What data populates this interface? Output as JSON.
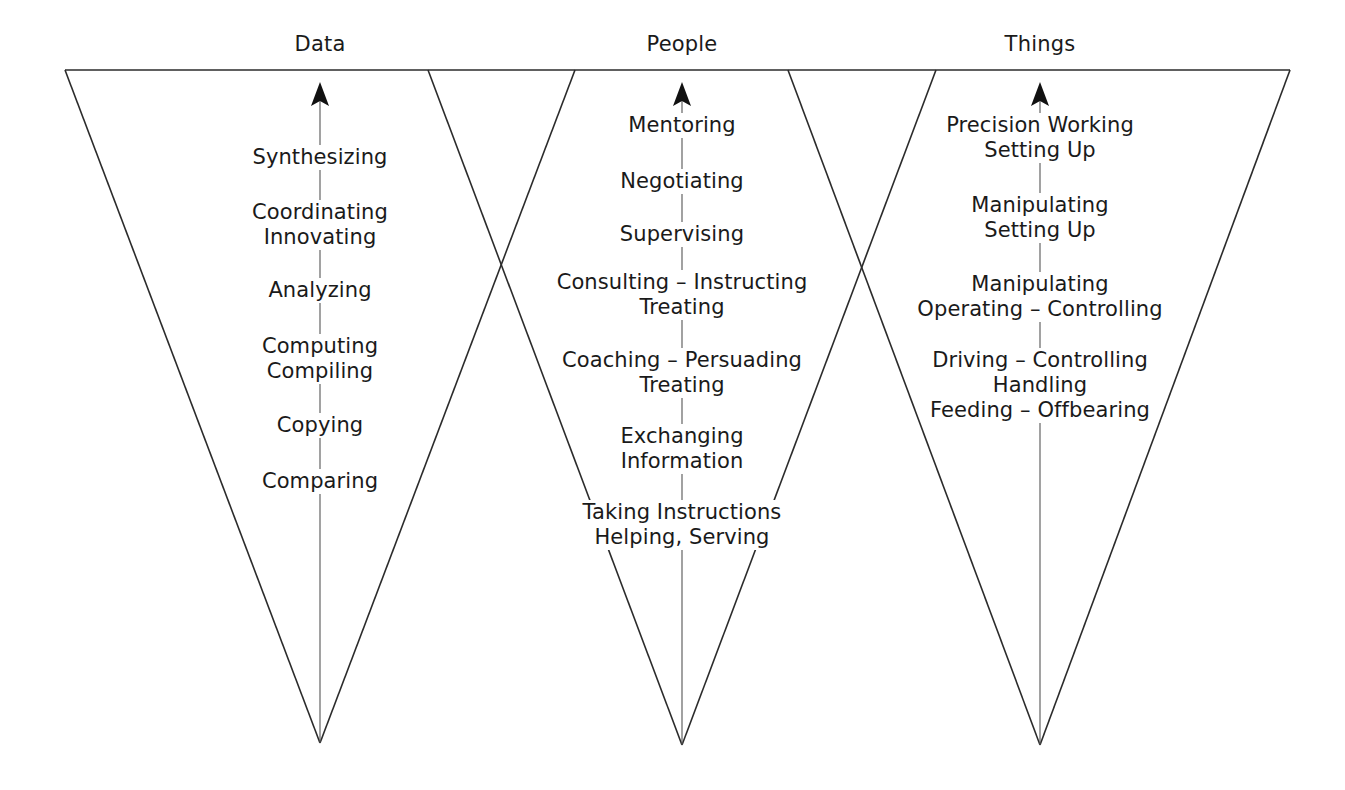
{
  "diagram": {
    "title_visible": false,
    "background_color": "#ffffff",
    "line_color": "#2b2b2b",
    "text_color": "#1a1a1a",
    "columns": [
      {
        "id": "data",
        "header": "Data",
        "center_x": 320,
        "arrow_label": "upward-arrow",
        "levels": [
          {
            "lines": [
              "Synthesizing"
            ]
          },
          {
            "lines": [
              "Coordinating",
              "Innovating"
            ]
          },
          {
            "lines": [
              "Analyzing"
            ]
          },
          {
            "lines": [
              "Computing",
              "Compiling"
            ]
          },
          {
            "lines": [
              "Copying"
            ]
          },
          {
            "lines": [
              "Comparing"
            ]
          }
        ]
      },
      {
        "id": "people",
        "header": "People",
        "center_x": 682,
        "arrow_label": "upward-arrow",
        "levels": [
          {
            "lines": [
              "Mentoring"
            ]
          },
          {
            "lines": [
              "Negotiating"
            ]
          },
          {
            "lines": [
              "Supervising"
            ]
          },
          {
            "lines": [
              "Consulting – Instructing",
              "Treating"
            ]
          },
          {
            "lines": [
              "Coaching – Persuading",
              "Treating"
            ]
          },
          {
            "lines": [
              "Exchanging",
              "Information"
            ]
          },
          {
            "lines": [
              "Taking Instructions",
              "Helping, Serving"
            ]
          }
        ]
      },
      {
        "id": "things",
        "header": "Things",
        "center_x": 1040,
        "arrow_label": "upward-arrow",
        "levels": [
          {
            "lines": [
              "Precision Working",
              "Setting Up"
            ]
          },
          {
            "lines": [
              "Manipulating",
              "Setting Up"
            ]
          },
          {
            "lines": [
              "Manipulating",
              "Operating – Controlling"
            ]
          },
          {
            "lines": [
              "Driving – Controlling",
              "Handling",
              "Feeding – Offbearing"
            ]
          }
        ]
      }
    ]
  }
}
